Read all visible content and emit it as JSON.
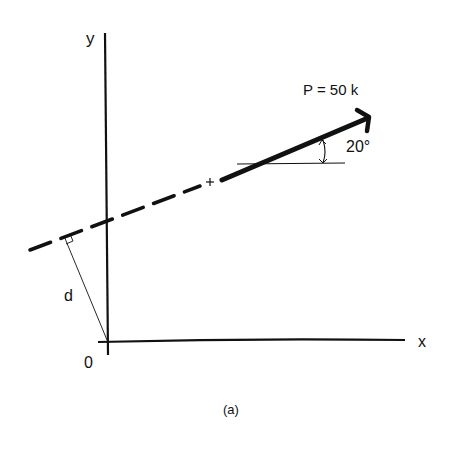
{
  "figure": {
    "caption": "(a)",
    "axes": {
      "x_label": "x",
      "y_label": "y",
      "origin_label": "0"
    },
    "force": {
      "label": "P = 50 k",
      "magnitude": 50,
      "unit": "k",
      "angle_label": "20°",
      "angle_deg": 20
    },
    "distance_label": "d",
    "colors": {
      "ink": "#111111",
      "background": "#ffffff"
    }
  }
}
